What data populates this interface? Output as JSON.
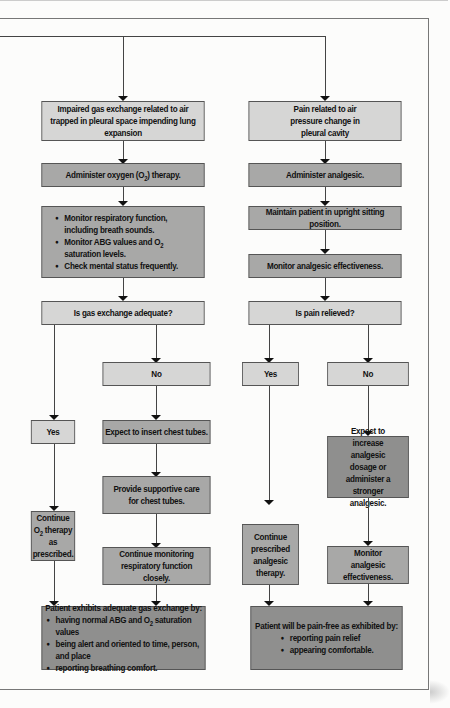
{
  "flowchart": {
    "left_branch": {
      "diagnosis": "Impaired gas exchange related to air trapped in pleural space impending lung expansion",
      "step1": {
        "pre": "Administer oxygen (O",
        "sub": "2",
        "post": ") therapy."
      },
      "step2_items": [
        "Monitor respiratory function, including breath sounds.",
        {
          "pre": "Monitor ABG values and O",
          "sub": "2",
          "post": " saturation levels."
        },
        "Check mental status frequently."
      ],
      "decision": "Is gas exchange adequate?",
      "yes_label": "Yes",
      "no_label": "No",
      "yes_action": {
        "pre": "Continue O",
        "sub": "2",
        "post": " therapy as prescribed."
      },
      "no_actions": [
        "Expect to insert chest tubes.",
        "Provide supportive care for chest tubes.",
        "Continue monitoring respiratory function closely."
      ],
      "outcome": {
        "title": "Patient exhibits adequate gas exchange by:",
        "items": [
          {
            "pre": "having normal ABG and O",
            "sub": "2",
            "post": " saturation values"
          },
          "being alert and oriented to time, person, and place",
          "reporting breathing comfort."
        ]
      }
    },
    "right_branch": {
      "diagnosis": "Pain related to air pressure change in pleural cavity",
      "steps": [
        "Administer analgesic.",
        "Maintain patient in upright sitting position.",
        "Monitor analgesic effectiveness."
      ],
      "decision": "Is pain relieved?",
      "yes_label": "Yes",
      "no_label": "No",
      "yes_action": "Continue prescribed analgesic therapy.",
      "no_actions": [
        "Expect to increase analgesic dosage or administer a stronger analgesic.",
        "Monitor analgesic effectiveness."
      ],
      "outcome": {
        "title": "Patient will be pain-free as exhibited by:",
        "items": [
          "reporting pain relief",
          "appearing comfortable."
        ]
      }
    }
  }
}
